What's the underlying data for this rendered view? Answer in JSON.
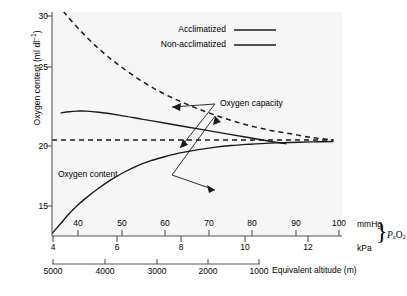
{
  "chart_data": {
    "type": "line",
    "title": "",
    "ylabel": "Oxygen content (ml dl–1)",
    "ylabel_main": "Oxygen content (ml dl",
    "ylabel_sup": "–1",
    "ylabel_tail": ")",
    "ylim": [
      12.2,
      30.4
    ],
    "yticks": [
      30,
      25,
      20,
      15
    ],
    "ytick_labels": [
      "30",
      "25",
      "20",
      "15"
    ],
    "grid": false,
    "xaxes": [
      {
        "name": "mmHg",
        "unit_label": "mmHg",
        "position": "primary-top-of-axisline",
        "range": [
          34,
          102
        ],
        "ticks": [
          40,
          50,
          60,
          70,
          80,
          90,
          100
        ],
        "tick_labels": [
          "40",
          "50",
          "60",
          "70",
          "80",
          "90",
          "100"
        ]
      },
      {
        "name": "kPa",
        "unit_label": "kPa",
        "position": "primary-below-axisline",
        "range": [
          4.53,
          13.6
        ],
        "ticks": [
          4,
          6,
          8,
          10,
          12
        ],
        "tick_labels": [
          "4",
          "6",
          "8",
          "10",
          "12"
        ]
      },
      {
        "name": "Equivalent altitude (m)",
        "unit_label": "Equivalent altitude (m)",
        "position": "secondary-bottom",
        "ticks": [
          5000,
          4000,
          3000,
          2000,
          1000
        ],
        "tick_labels": [
          "5000",
          "4000",
          "3000",
          "2000",
          "1000"
        ]
      }
    ],
    "axis_group_label": "PaO2",
    "axis_group_label_parts": {
      "p": "P",
      "a": "a",
      "o": "O",
      "two": "2"
    },
    "legend": {
      "position": "top-right-inside",
      "entries": [
        {
          "label": "Acclimatized",
          "style": "solid",
          "color": "#1a1a1a"
        },
        {
          "label": "Non-acclimatized",
          "style": "solid",
          "color": "#1a1a1a"
        }
      ]
    },
    "annotations": [
      {
        "text": "Oxygen capacity",
        "x_px": 222,
        "y_px": 104
      },
      {
        "text": "Oxygen content",
        "x_px": 58,
        "y_px": 170
      }
    ],
    "series": [
      {
        "name": "Oxygen capacity – acclimatized",
        "style": "dashed",
        "color": "#1a1a1a",
        "comment": "Haemoglobin concentration rises with acclimatization so capacity falls steeply from high values at altitude toward ~20 ml/dl at sea level",
        "points": [
          [
            34,
            31.6
          ],
          [
            38,
            29.9
          ],
          [
            42,
            28.4
          ],
          [
            46,
            27.1
          ],
          [
            50,
            26.0
          ],
          [
            55,
            24.8
          ],
          [
            60,
            23.8
          ],
          [
            65,
            23.0
          ],
          [
            70,
            22.3
          ],
          [
            75,
            21.7
          ],
          [
            80,
            21.2
          ],
          [
            85,
            20.8
          ],
          [
            90,
            20.5
          ],
          [
            95,
            20.2
          ],
          [
            100,
            20.0
          ]
        ]
      },
      {
        "name": "Oxygen capacity – non-acclimatized",
        "style": "dashed",
        "color": "#1a1a1a",
        "comment": "Flat at the normal sea-level oxygen capacity of 20 ml/dl",
        "points": [
          [
            34,
            20.0
          ],
          [
            100,
            20.0
          ]
        ]
      },
      {
        "name": "Oxygen content – acclimatized",
        "style": "solid",
        "color": "#1a1a1a",
        "comment": "Higher than sea-level content at altitude, declining gently to ~19.5 at 90 mmHg",
        "points": [
          [
            36,
            22.2
          ],
          [
            38,
            22.3
          ],
          [
            40,
            22.35
          ],
          [
            42,
            22.35
          ],
          [
            45,
            22.25
          ],
          [
            50,
            22.0
          ],
          [
            55,
            21.7
          ],
          [
            60,
            21.4
          ],
          [
            65,
            21.1
          ],
          [
            70,
            20.8
          ],
          [
            75,
            20.5
          ],
          [
            80,
            20.2
          ],
          [
            85,
            19.9
          ],
          [
            89,
            19.7
          ]
        ]
      },
      {
        "name": "Oxygen content – non-acclimatized",
        "style": "solid",
        "color": "#1a1a1a",
        "comment": "Follows the oxyhaemoglobin dissociation curve, rising from ~12.5 at 34 mmHg to ~19.8 at 100 mmHg",
        "points": [
          [
            34,
            12.4
          ],
          [
            36,
            13.2
          ],
          [
            38,
            14.0
          ],
          [
            40,
            14.7
          ],
          [
            42,
            15.3
          ],
          [
            45,
            16.1
          ],
          [
            48,
            16.8
          ],
          [
            51,
            17.4
          ],
          [
            54,
            17.9
          ],
          [
            57,
            18.3
          ],
          [
            60,
            18.6
          ],
          [
            64,
            18.95
          ],
          [
            68,
            19.2
          ],
          [
            72,
            19.4
          ],
          [
            76,
            19.55
          ],
          [
            80,
            19.65
          ],
          [
            85,
            19.75
          ],
          [
            90,
            19.8
          ],
          [
            95,
            19.85
          ],
          [
            100,
            19.88
          ]
        ]
      }
    ]
  }
}
